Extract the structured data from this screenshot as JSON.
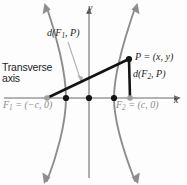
{
  "figure": {
    "type": "hyperbola-definition-diagram",
    "labels": {
      "transverse_line1": "Transverse",
      "transverse_line2": "axis",
      "d_f1_p": "d(F1, P)",
      "d_f1_p_parts": {
        "d": "d(",
        "f": "F",
        "sub": "1",
        "rest": ", P)"
      },
      "d_f2_p_parts": {
        "d": "d(",
        "f": "F",
        "sub": "2",
        "rest": ", P)"
      },
      "point_p": "P = (x, y)",
      "point_p_parts": {
        "p": "P",
        "eq": " = (",
        "x": "x",
        "comma": ", ",
        "y": "y",
        "close": ")"
      },
      "focus_1_parts": {
        "f": "F",
        "sub": "1",
        "eq": " = (−",
        "c": "c",
        "rest": ", 0)"
      },
      "focus_2_parts": {
        "f": "F",
        "sub": "2",
        "eq": " = (",
        "c": "c",
        "rest": ", 0)"
      },
      "axis_y": "y",
      "axis_x": "x"
    },
    "colors": {
      "curve": "#8a8a8a",
      "axis": "#9a9a9a",
      "segment": "#141414",
      "vertex_dot": "#141414",
      "focus_dot": "#9e9e9e",
      "text_dark": "#1d1d1d",
      "text_gray": "#8c8c8c",
      "leader": "#a6a6a6",
      "background": "#fdfdfd"
    },
    "geometry": {
      "origin": {
        "x": 89,
        "y": 98
      },
      "focus_1": {
        "x": 47,
        "y": 98
      },
      "focus_2": {
        "x": 130,
        "y": 98
      },
      "vertex_left": {
        "x": 66,
        "y": 98
      },
      "vertex_right": {
        "x": 114,
        "y": 98
      },
      "point_p": {
        "x": 129,
        "y": 59
      },
      "x_axis_y": 98,
      "y_axis_x": 89
    }
  }
}
